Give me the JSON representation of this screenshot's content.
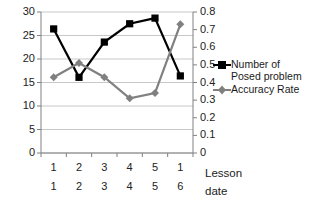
{
  "chart_data": {
    "type": "line",
    "title": "",
    "xlabel": "Lesson\ndate",
    "ylabel": "",
    "categories": [
      "1",
      "2",
      "3",
      "4",
      "5",
      "1"
    ],
    "x_tick_rows": [
      [
        "1",
        "2",
        "3",
        "4",
        "5",
        "1"
      ],
      [
        "1",
        "2",
        "3",
        "4",
        "5",
        "6"
      ]
    ],
    "grid": true,
    "legend_position": "right",
    "axes": {
      "left": {
        "ylim": [
          0,
          30
        ],
        "ticks": [
          "0",
          "5",
          "10",
          "15",
          "20",
          "25",
          "30"
        ],
        "tick_values": [
          0,
          5,
          10,
          15,
          20,
          25,
          30
        ]
      },
      "right": {
        "ylim": [
          0,
          0.8
        ],
        "ticks": [
          "0",
          "0.1",
          "0.2",
          "0.3",
          "0.4",
          "0.5",
          "0.6",
          "0.7",
          "0.8"
        ],
        "tick_values": [
          0,
          0.1,
          0.2,
          0.3,
          0.4,
          0.5,
          0.6,
          0.7,
          0.8
        ]
      }
    },
    "series": [
      {
        "name": "Number of\nPosed problem",
        "axis": "left",
        "color": "#000000",
        "marker": "square",
        "values": [
          26.4,
          16.1,
          23.6,
          27.5,
          28.7,
          16.4
        ]
      },
      {
        "name": "Accuracy Rate",
        "axis": "right",
        "color": "#808080",
        "marker": "diamond",
        "values": [
          0.43,
          0.51,
          0.43,
          0.31,
          0.34,
          0.73
        ]
      }
    ]
  },
  "legend": {
    "items": [
      {
        "label": "Number of\nPosed problem",
        "color": "#000000",
        "marker": "square"
      },
      {
        "label": "Accuracy Rate",
        "color": "#808080",
        "marker": "diamond"
      }
    ]
  },
  "axis_title": {
    "line1": "Lesson",
    "line2": "date"
  },
  "colors": {
    "series_primary": "#000000",
    "series_secondary": "#808080",
    "grid": "#c8c8c8",
    "axis": "#808080",
    "text": "#1a1a1a",
    "background": "#ffffff"
  }
}
